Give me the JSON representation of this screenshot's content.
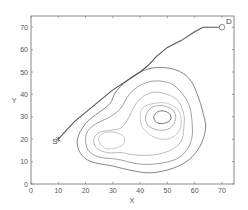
{
  "chart_data": {
    "type": "line",
    "title": "",
    "xlabel": "X",
    "ylabel": "Y",
    "xlim": [
      0,
      74.4
    ],
    "ylim": [
      0,
      75
    ],
    "grid": false,
    "legend": null,
    "xticks": [
      0,
      10,
      20,
      30,
      40,
      50,
      60,
      70
    ],
    "yticks": [
      0,
      10,
      20,
      30,
      40,
      50,
      60,
      70
    ],
    "series": [
      {
        "name": "path",
        "color": "#555555",
        "points": [
          [
            10,
            20
          ],
          [
            13,
            24
          ],
          [
            16,
            28
          ],
          [
            20,
            32
          ],
          [
            25,
            37
          ],
          [
            30,
            42
          ],
          [
            35,
            46
          ],
          [
            40,
            50
          ],
          [
            43,
            53
          ],
          [
            46,
            57
          ],
          [
            50,
            61
          ],
          [
            55,
            64
          ],
          [
            60,
            68
          ],
          [
            63,
            70
          ],
          [
            66,
            70
          ],
          [
            70,
            70
          ]
        ]
      }
    ],
    "contours": [
      {
        "level": 1,
        "color": "#666666",
        "points": [
          [
            17,
            20
          ],
          [
            18,
            14
          ],
          [
            22,
            10
          ],
          [
            30,
            8
          ],
          [
            37,
            6
          ],
          [
            44,
            5
          ],
          [
            52,
            7
          ],
          [
            58,
            11
          ],
          [
            62,
            17
          ],
          [
            64,
            25
          ],
          [
            63,
            32
          ],
          [
            61,
            40
          ],
          [
            58,
            47
          ],
          [
            53,
            51
          ],
          [
            46,
            52
          ],
          [
            40,
            50
          ],
          [
            35,
            46
          ],
          [
            31,
            41
          ],
          [
            29,
            36
          ],
          [
            25,
            32
          ],
          [
            20,
            27
          ],
          [
            17,
            20
          ]
        ]
      },
      {
        "level": 2,
        "color": "#888888",
        "points": [
          [
            20,
            20
          ],
          [
            21,
            15
          ],
          [
            25,
            12
          ],
          [
            32,
            11
          ],
          [
            39,
            9
          ],
          [
            46,
            9
          ],
          [
            53,
            11
          ],
          [
            57,
            15
          ],
          [
            59,
            21
          ],
          [
            59,
            28
          ],
          [
            58,
            35
          ],
          [
            55,
            41
          ],
          [
            51,
            45
          ],
          [
            45,
            46
          ],
          [
            40,
            44
          ],
          [
            36,
            40
          ],
          [
            33,
            34
          ],
          [
            29,
            30
          ],
          [
            24,
            27
          ],
          [
            21,
            24
          ],
          [
            20,
            20
          ]
        ]
      },
      {
        "level": 3,
        "color": "#aaaaaa",
        "points": [
          [
            23,
            20
          ],
          [
            24,
            16
          ],
          [
            28,
            14
          ],
          [
            33,
            14
          ],
          [
            38,
            13
          ],
          [
            45,
            13
          ],
          [
            51,
            15
          ],
          [
            55,
            19
          ],
          [
            56,
            25
          ],
          [
            56,
            31
          ],
          [
            54,
            37
          ],
          [
            50,
            40
          ],
          [
            45,
            41
          ],
          [
            41,
            39
          ],
          [
            38,
            35
          ],
          [
            36,
            30
          ],
          [
            33,
            25
          ],
          [
            29,
            24
          ],
          [
            25,
            23
          ],
          [
            23,
            20
          ]
        ]
      },
      {
        "level": 4,
        "color": "#bbbbbb",
        "points": [
          [
            25,
            19
          ],
          [
            27,
            16
          ],
          [
            31,
            16
          ],
          [
            34,
            18
          ],
          [
            34,
            21
          ],
          [
            31,
            23
          ],
          [
            27,
            23
          ],
          [
            25,
            21
          ],
          [
            25,
            19
          ]
        ]
      },
      {
        "level": 5,
        "color": "#bbbbbb",
        "points": [
          [
            40,
            30
          ],
          [
            41,
            25
          ],
          [
            45,
            21
          ],
          [
            50,
            20
          ],
          [
            54,
            23
          ],
          [
            55,
            28
          ],
          [
            54,
            33
          ],
          [
            50,
            36
          ],
          [
            45,
            36
          ],
          [
            41,
            34
          ],
          [
            40,
            30
          ]
        ]
      },
      {
        "level": 6,
        "color": "#999999",
        "points": [
          [
            42,
            30
          ],
          [
            43,
            26
          ],
          [
            47,
            24
          ],
          [
            51,
            25
          ],
          [
            53,
            29
          ],
          [
            52,
            33
          ],
          [
            48,
            35
          ],
          [
            44,
            34
          ],
          [
            42,
            30
          ]
        ]
      },
      {
        "level": 7,
        "color": "#555555",
        "points": [
          [
            45,
            30
          ],
          [
            46,
            27.5
          ],
          [
            48.5,
            27
          ],
          [
            51,
            28.5
          ],
          [
            51,
            31
          ],
          [
            49,
            32.5
          ],
          [
            46.5,
            32.3
          ],
          [
            45,
            30
          ]
        ]
      }
    ],
    "annotations": [
      {
        "text": "S",
        "x": 10,
        "y": 20,
        "marker": "star"
      },
      {
        "text": "D",
        "x": 70,
        "y": 70,
        "marker": "circle"
      }
    ]
  },
  "labels": {
    "x_axis": "X",
    "y_axis": "Y",
    "start": "S",
    "destination": "D"
  },
  "ticks": {
    "x": [
      "0",
      "10",
      "20",
      "30",
      "40",
      "50",
      "60",
      "70"
    ],
    "y": [
      "0",
      "10",
      "20",
      "30",
      "40",
      "50",
      "60",
      "70"
    ]
  }
}
